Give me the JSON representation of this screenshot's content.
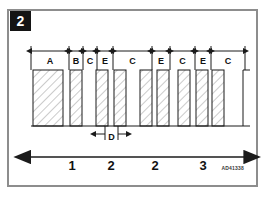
{
  "figure": {
    "step_badge": "2",
    "reference_code": "AD41338",
    "frame_color": "#8d8d8d",
    "line_color": "#1b1b1b",
    "hatch_color": "#7e7e7e",
    "badge_bg": "#141414",
    "badge_fg": "#ffffff"
  },
  "top_dimensions": [
    {
      "label": "A",
      "x1": 31,
      "x2": 69
    },
    {
      "label": "B",
      "x1": 69,
      "x2": 83
    },
    {
      "label": "C",
      "x1": 83,
      "x2": 97
    },
    {
      "label": "E",
      "x1": 97,
      "x2": 113
    },
    {
      "label": "C",
      "x1": 113,
      "x2": 152
    },
    {
      "label": "E",
      "x1": 152,
      "x2": 170
    },
    {
      "label": "C",
      "x1": 170,
      "x2": 195
    },
    {
      "label": "E",
      "x1": 195,
      "x2": 211
    },
    {
      "label": "C",
      "x1": 211,
      "x2": 245
    }
  ],
  "bars": [
    {
      "x": 33,
      "width": 30,
      "hatched": true
    },
    {
      "x": 70,
      "width": 12,
      "hatched": true
    },
    {
      "x": 96,
      "width": 12,
      "hatched": true
    },
    {
      "x": 114,
      "width": 12,
      "hatched": true
    },
    {
      "x": 140,
      "width": 12,
      "hatched": true
    },
    {
      "x": 157,
      "width": 12,
      "hatched": true
    },
    {
      "x": 178,
      "width": 12,
      "hatched": true
    },
    {
      "x": 196,
      "width": 12,
      "hatched": true
    },
    {
      "x": 212,
      "width": 12,
      "hatched": true
    }
  ],
  "gap_dimension": {
    "label": "D",
    "x1": 105,
    "x2": 118
  },
  "axis": {
    "x1": 31,
    "x2": 245,
    "y": 157,
    "left_arrow": true,
    "right_arrow": true,
    "ticks": [
      {
        "label": "1",
        "x": 72
      },
      {
        "label": "2",
        "x": 111
      },
      {
        "label": "2",
        "x": 155
      },
      {
        "label": "3",
        "x": 203
      }
    ]
  },
  "geometry": {
    "dim_line_y": 51,
    "dim_label_y": 64,
    "bar_top_y": 70,
    "bar_bottom_y": 126,
    "gap_line_y": 134,
    "gap_label_y": 140,
    "step_x": 243,
    "step_top_y": 70,
    "step_right_x": 250
  }
}
